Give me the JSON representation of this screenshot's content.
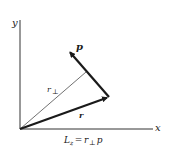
{
  "diagram": {
    "type": "vector-diagram",
    "axes": {
      "x_label": "x",
      "y_label": "y",
      "origin": [
        20,
        129
      ]
    },
    "vectors": [
      {
        "name": "r",
        "label": "r",
        "from": [
          20,
          129
        ],
        "to": [
          109,
          97
        ],
        "style": "bold-arrow"
      },
      {
        "name": "p",
        "label": "p",
        "from": [
          109,
          97
        ],
        "to": [
          68,
          50
        ],
        "style": "bold-arrow"
      },
      {
        "name": "r_perp",
        "label_main": "r",
        "label_sub": "⊥",
        "from": [
          20,
          129
        ],
        "to": [
          86,
          72
        ],
        "style": "thin-line"
      }
    ],
    "equation": {
      "lhs_main": "L",
      "lhs_sub": "z",
      "eq": " = ",
      "rhs_main": "r",
      "rhs_sub": "⊥",
      "rhs_tail": " p"
    },
    "colors": {
      "ink": "#1a1a1a",
      "axis": "#333333",
      "background": "#ffffff"
    }
  }
}
